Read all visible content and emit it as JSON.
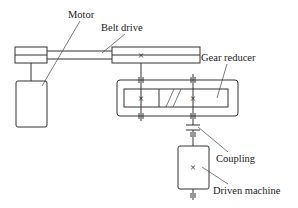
{
  "diagram": {
    "type": "mechanical-transmission-schematic",
    "labels": {
      "motor": "Motor",
      "belt_drive": "Belt drive",
      "gear_reducer": "Gear reducer",
      "coupling": "Coupling",
      "driven_machine": "Driven machine"
    },
    "symbols": {
      "cross": "×"
    },
    "components": [
      {
        "id": "motor",
        "label": "Motor"
      },
      {
        "id": "belt_drive",
        "label": "Belt drive"
      },
      {
        "id": "gear_reducer",
        "label": "Gear reducer"
      },
      {
        "id": "coupling",
        "label": "Coupling"
      },
      {
        "id": "driven_machine",
        "label": "Driven machine"
      }
    ],
    "connections": [
      {
        "from": "motor",
        "to": "belt_drive"
      },
      {
        "from": "belt_drive",
        "to": "gear_reducer"
      },
      {
        "from": "gear_reducer",
        "to": "coupling"
      },
      {
        "from": "coupling",
        "to": "driven_machine"
      }
    ],
    "colors": {
      "line": "#333333",
      "background": "#ffffff"
    }
  }
}
